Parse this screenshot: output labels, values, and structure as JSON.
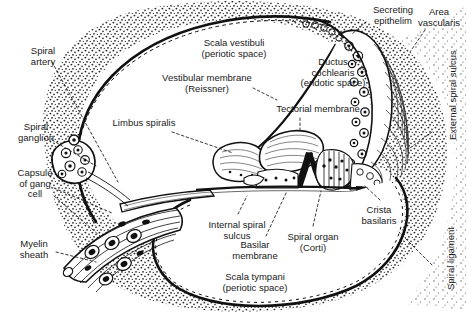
{
  "figure": {
    "background_color": "#ffffff",
    "ink_color": "#1a1a1a",
    "width": 467,
    "height": 321
  },
  "labels": [
    {
      "id": "spiral-artery",
      "text": "Spiral\nartery",
      "x": 14,
      "y": 46,
      "w": 58,
      "align": "center"
    },
    {
      "id": "spiral-ganglion",
      "text": "Spiral\nganglion",
      "x": 4,
      "y": 122,
      "w": 64,
      "align": "center"
    },
    {
      "id": "capsule-of-gang-cell",
      "text": "Capsule\nof gang\ncell",
      "x": 6,
      "y": 168,
      "w": 58,
      "align": "center"
    },
    {
      "id": "myelin-sheath",
      "text": "Myelin\nsheath",
      "x": 6,
      "y": 239,
      "w": 56,
      "align": "center"
    },
    {
      "id": "scala-vestibuli",
      "text": "Scala vestibuli\n(periotic space)",
      "x": 182,
      "y": 38,
      "w": 104,
      "align": "center"
    },
    {
      "id": "vestibular-membrane",
      "text": "Vestibular membrane\n(Reissner)",
      "x": 143,
      "y": 73,
      "w": 128,
      "align": "center"
    },
    {
      "id": "limbus-spiralis",
      "text": "Limbus spiralis",
      "x": 102,
      "y": 118,
      "w": 84,
      "align": "center"
    },
    {
      "id": "tectorial-membrane",
      "text": "Tectorial membrane",
      "x": 262,
      "y": 104,
      "w": 112,
      "align": "center"
    },
    {
      "id": "ductus-cochlearis",
      "text": "Ductus\ncochlearis\n(endotic space)",
      "x": 286,
      "y": 57,
      "w": 94,
      "align": "center"
    },
    {
      "id": "secreting-epithelium",
      "text": "Secreting\nepithelim",
      "x": 360,
      "y": 5,
      "w": 66,
      "align": "center"
    },
    {
      "id": "area-vascularis",
      "text": "Area\nvascularis",
      "x": 414,
      "y": 7,
      "w": 50,
      "align": "center"
    },
    {
      "id": "internal-spiral-sulcus",
      "text": "Internal spiral\nsulcus",
      "x": 196,
      "y": 220,
      "w": 82,
      "align": "center"
    },
    {
      "id": "basilar-membrane",
      "text": "Basilar\nmembrane",
      "x": 224,
      "y": 240,
      "w": 62,
      "align": "center"
    },
    {
      "id": "spiral-organ-corti",
      "text": "Spiral organ\n(Corti)",
      "x": 275,
      "y": 232,
      "w": 76,
      "align": "center"
    },
    {
      "id": "crista-basilaris",
      "text": "Crista\nbasilaris",
      "x": 352,
      "y": 205,
      "w": 54,
      "align": "center"
    },
    {
      "id": "scala-tympani",
      "text": "Scala tympani\n(periotic space)",
      "x": 205,
      "y": 272,
      "w": 100,
      "align": "center"
    }
  ],
  "rotated_labels": [
    {
      "id": "external-spiral-sulcus",
      "text": "External spiral sulcus",
      "x": 448,
      "y": 140
    },
    {
      "id": "spiral-ligament",
      "text": "Spiral  ligament",
      "x": 446,
      "y": 290
    }
  ],
  "leaders": [
    {
      "id": "leader-spiral-artery",
      "from": [
        52,
        62
      ],
      "to": [
        118,
        182
      ]
    },
    {
      "id": "leader-spiral-ganglion",
      "from": [
        52,
        140
      ],
      "to": [
        96,
        166
      ]
    },
    {
      "id": "leader-capsule-gang-a",
      "from": [
        54,
        188
      ],
      "to": [
        112,
        213
      ]
    },
    {
      "id": "leader-capsule-gang-b",
      "from": [
        54,
        196
      ],
      "to": [
        100,
        236
      ]
    },
    {
      "id": "leader-myelin-sheath",
      "from": [
        56,
        252
      ],
      "to": [
        96,
        262
      ]
    },
    {
      "id": "leader-vestibular-membrane",
      "from": [
        253,
        88
      ],
      "to": [
        277,
        100
      ]
    },
    {
      "id": "leader-limbus-spiralis",
      "from": [
        172,
        132
      ],
      "to": [
        233,
        153
      ]
    },
    {
      "id": "leader-tectorial-membrane",
      "from": [
        300,
        118
      ],
      "to": [
        300,
        133
      ]
    },
    {
      "id": "leader-internal-spiral-sulcus",
      "from": [
        238,
        214
      ],
      "to": [
        247,
        196
      ]
    },
    {
      "id": "leader-basilar-membrane",
      "from": [
        266,
        236
      ],
      "to": [
        287,
        191
      ]
    },
    {
      "id": "leader-spiral-organ-corti",
      "from": [
        313,
        226
      ],
      "to": [
        321,
        191
      ]
    },
    {
      "id": "leader-crista-basilaris",
      "from": [
        380,
        200
      ],
      "to": [
        365,
        186
      ]
    },
    {
      "id": "leader-spiral-ligament",
      "from": [
        432,
        265
      ],
      "to": [
        399,
        232
      ]
    },
    {
      "id": "leader-external-spiral-sulcus",
      "from": [
        432,
        132
      ],
      "to": [
        410,
        148
      ]
    },
    {
      "id": "leader-secreting-epithelium",
      "from": [
        366,
        22
      ],
      "to": [
        352,
        34
      ]
    },
    {
      "id": "leader-area-vascularis",
      "from": [
        425,
        30
      ],
      "to": [
        410,
        52
      ]
    }
  ],
  "structures": [
    {
      "id": "otic-capsule-bone",
      "name": "stippled periotic bone"
    },
    {
      "id": "scala-vestibuli",
      "name": "upper periotic space"
    },
    {
      "id": "scala-tympani",
      "name": "lower periotic space"
    },
    {
      "id": "ductus-cochlearis",
      "name": "triangular endolymphatic duct"
    },
    {
      "id": "stria-vascularis",
      "name": "vascular stria along lateral wall"
    },
    {
      "id": "organ-of-corti",
      "name": "sensory epithelium on basilar membrane"
    },
    {
      "id": "spiral-ganglion",
      "name": "ganglion cell cluster"
    },
    {
      "id": "cochlear-nerve",
      "name": "myelinated nerve fibre bundle"
    }
  ]
}
